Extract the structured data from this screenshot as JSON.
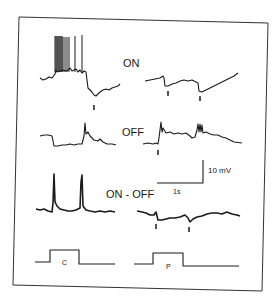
{
  "figure": {
    "rows": [
      {
        "label": "ON",
        "left_markers": 1,
        "right_markers": 2
      },
      {
        "label": "OFF",
        "left_markers": 0,
        "right_markers": 1
      },
      {
        "label": "ON - OFF",
        "left_markers": 0,
        "right_markers": 2
      }
    ],
    "scale_bar": {
      "voltage": "10 mV",
      "time": "1s"
    },
    "stimulus": [
      {
        "label": "C"
      },
      {
        "label": "P"
      }
    ],
    "colors": {
      "ink": "#1a1a1a",
      "background": "#ffffff"
    }
  }
}
